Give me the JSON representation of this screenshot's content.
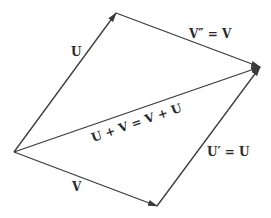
{
  "diagram": {
    "points": {
      "origin": [
        14,
        152
      ],
      "u_tip": [
        116,
        13
      ],
      "sum_tip": [
        260,
        67
      ],
      "v_tip": [
        157,
        206
      ]
    },
    "vectors": [
      {
        "id": "U",
        "from": "origin",
        "to": "u_tip",
        "label": "U"
      },
      {
        "id": "V_double_prime",
        "from": "u_tip",
        "to": "sum_tip",
        "label": "V″ = V"
      },
      {
        "id": "sum",
        "from": "origin",
        "to": "sum_tip",
        "label": "U + V = V + U"
      },
      {
        "id": "V",
        "from": "origin",
        "to": "v_tip",
        "label": "V"
      },
      {
        "id": "U_prime",
        "from": "v_tip",
        "to": "sum_tip",
        "label": "U′ = U"
      }
    ],
    "colors": {
      "line": "#3a3a3a",
      "text": "#2a2a2a",
      "background": "#ffffff"
    }
  }
}
